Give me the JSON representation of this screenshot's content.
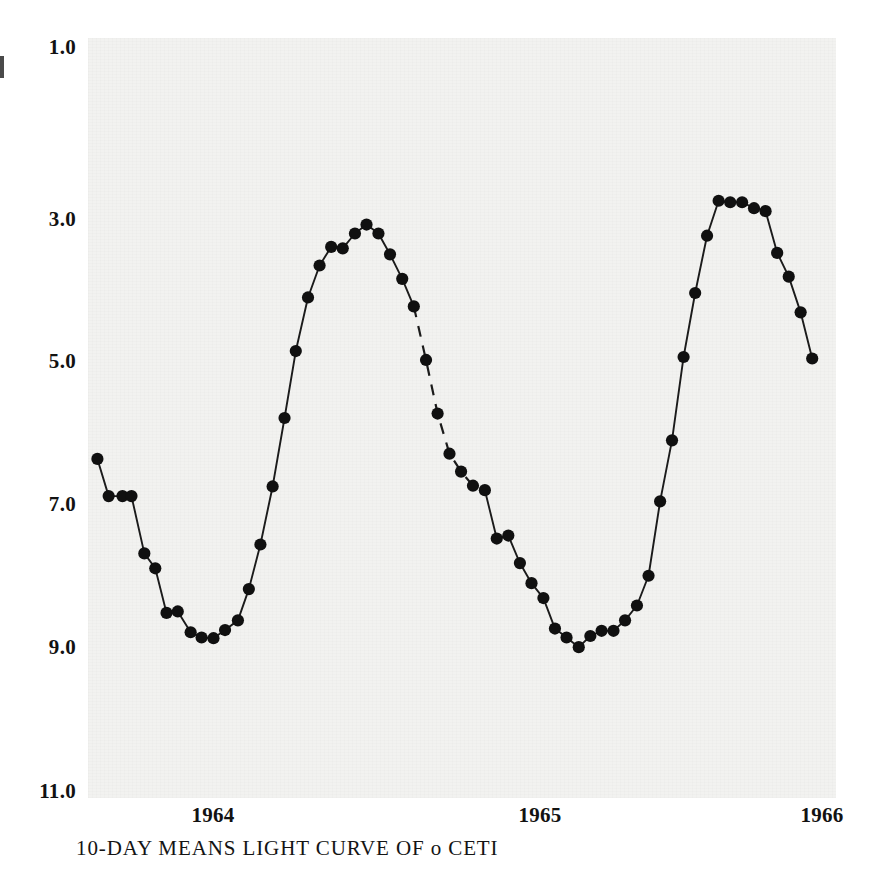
{
  "figure": {
    "caption": "10-DAY MEANS LIGHT CURVE OF o CETI",
    "panel_bg": "#f2f2f0",
    "ink": "#111111"
  },
  "chart_data": {
    "type": "line",
    "title": "10-DAY MEANS LIGHT CURVE OF o CETI",
    "xlabel": "",
    "ylabel": "",
    "y_inverted": true,
    "ylim": [
      1.0,
      11.0
    ],
    "yticks": [
      "1.0",
      "3.0",
      "5.0",
      "7.0",
      "9.0",
      "11.0"
    ],
    "ytick_values": [
      1.0,
      3.0,
      5.0,
      7.0,
      9.0,
      11.0
    ],
    "xticks": [
      "1964",
      "1965",
      "1966"
    ],
    "xtick_values": [
      1964.0,
      1965.0,
      1966.0
    ],
    "xlim": [
      1963.78,
      1966.1
    ],
    "grid": false,
    "legend": null,
    "marker": "filled-circle",
    "series": [
      {
        "name": "o Ceti visual magnitude (10-day means)",
        "x": [
          1963.803,
          1963.838,
          1963.881,
          1963.909,
          1963.949,
          1963.983,
          1964.018,
          1964.053,
          1964.093,
          1964.127,
          1964.164,
          1964.2,
          1964.24,
          1964.274,
          1964.31,
          1964.348,
          1964.385,
          1964.42,
          1964.458,
          1964.494,
          1964.53,
          1964.566,
          1964.604,
          1964.64,
          1964.677,
          1964.713,
          1964.751,
          1964.787,
          1964.825,
          1964.861,
          1964.898,
          1964.934,
          1964.971,
          1965.008
        ],
        "y": [
          6.55,
          7.05,
          7.05,
          7.05,
          7.82,
          8.02,
          8.62,
          8.6,
          8.88,
          8.95,
          8.96,
          8.85,
          8.72,
          8.3,
          7.7,
          6.92,
          6.0,
          5.1,
          4.38,
          3.95,
          3.7,
          3.72,
          3.52,
          3.4,
          3.52,
          3.8,
          4.13,
          4.5,
          5.22,
          5.94,
          6.48,
          6.72,
          6.91,
          6.97
        ],
        "note_segment_dashed": {
          "from_index": 27,
          "to_index": 33
        }
      },
      {
        "name": "o Ceti visual magnitude (10-day means, cycle 2)",
        "x": [
          1965.008,
          1965.045,
          1965.081,
          1965.117,
          1965.153,
          1965.19,
          1965.226,
          1965.262,
          1965.3,
          1965.336,
          1965.371,
          1965.408,
          1965.444,
          1965.481,
          1965.517,
          1965.553,
          1965.59,
          1965.626,
          1965.662,
          1965.699,
          1965.735,
          1965.771,
          1965.808,
          1965.845,
          1965.881,
          1965.917,
          1965.953,
          1965.99,
          1966.026
        ],
        "y": [
          6.97,
          7.62,
          7.58,
          7.95,
          8.22,
          8.42,
          8.83,
          8.95,
          9.08,
          8.93,
          8.86,
          8.86,
          8.72,
          8.52,
          8.12,
          7.12,
          6.3,
          5.18,
          4.32,
          3.55,
          3.08,
          3.1,
          3.1,
          3.18,
          3.22,
          3.78,
          4.1,
          4.58,
          5.2
        ]
      }
    ],
    "annotations": [
      {
        "type": "dashed-gap",
        "label": "interpolated (no observations)",
        "x_from": 1964.787,
        "x_to": 1965.008,
        "y_from": 4.5,
        "y_to": 6.97
      }
    ]
  },
  "axes": {
    "y_labels": [
      {
        "text": "1.0",
        "px_y": 46
      },
      {
        "text": "3.0",
        "px_y": 218
      },
      {
        "text": "5.0",
        "px_y": 360
      },
      {
        "text": "7.0",
        "px_y": 503
      },
      {
        "text": "9.0",
        "px_y": 646
      },
      {
        "text": "11.0",
        "px_y": 790
      }
    ],
    "x_labels": [
      {
        "text": "1964",
        "px_x": 213
      },
      {
        "text": "1965",
        "px_x": 540
      },
      {
        "text": "1966",
        "px_x": 822
      }
    ]
  }
}
